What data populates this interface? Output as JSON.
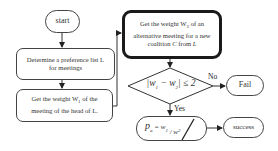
{
  "diagram": {
    "type": "flowchart",
    "nodes": {
      "start": "start",
      "step1": "Determine a preference list L for meetings",
      "step2": "Get the weight W1 of the meeting of the head of L",
      "step3": "Get the weight W2 of an alternative meeting for a new coalition C from L",
      "decision": "|w1 − w2| ≤ 2",
      "formula": "pa = w1 / w2",
      "fail": "Fail",
      "success": "success"
    },
    "edge_labels": {
      "no": "No",
      "yes": "Yes"
    },
    "parts": {
      "step2_pre": "Get the weight W",
      "step2_sub": "1",
      "step2_post": " of the meeting of the head of L.",
      "step1_text": "Determine a preference list L for meetings",
      "step3_pre": "Get the weight W",
      "step3_sub": "2",
      "step3_mid": " of an alternative meeting for a new coalition ",
      "step3_c": "C",
      "step3_from": " from ",
      "step3_l": "L",
      "dec_a": "|w",
      "dec_a_sub": "1",
      "dec_minus": " − w",
      "dec_b_sub": "2",
      "dec_end": "| ≤ 2",
      "f_p": "p",
      "f_p_sub": "a",
      "f_eq": " = w",
      "f_w1_sub": "1",
      "f_div": " / w",
      "f_w2_sub": "2"
    }
  }
}
